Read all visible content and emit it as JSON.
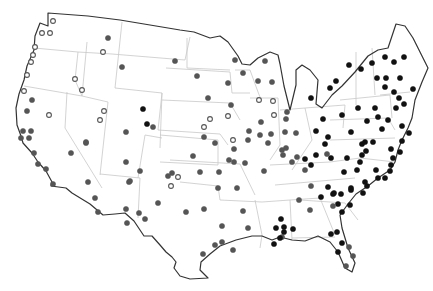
{
  "map": {
    "title": "",
    "region": "Contiguous United States",
    "marker_styles": {
      "open": {
        "fill": "#ffffff",
        "stroke": "#555555"
      },
      "gray": {
        "fill": "#555555",
        "stroke": "#555555"
      },
      "black": {
        "fill": "#111111",
        "stroke": "#111111"
      }
    },
    "points": [
      {
        "x": 53,
        "y": 21,
        "t": "open"
      },
      {
        "x": 42,
        "y": 33,
        "t": "open"
      },
      {
        "x": 50,
        "y": 33,
        "t": "open"
      },
      {
        "x": 35,
        "y": 47,
        "t": "open"
      },
      {
        "x": 33,
        "y": 55,
        "t": "open"
      },
      {
        "x": 31,
        "y": 62,
        "t": "open"
      },
      {
        "x": 27,
        "y": 75,
        "t": "open"
      },
      {
        "x": 24,
        "y": 91,
        "t": "open"
      },
      {
        "x": 32,
        "y": 100,
        "t": "gray"
      },
      {
        "x": 27,
        "y": 111,
        "t": "gray"
      },
      {
        "x": 49,
        "y": 115,
        "t": "open"
      },
      {
        "x": 23,
        "y": 131,
        "t": "gray"
      },
      {
        "x": 31,
        "y": 131,
        "t": "gray"
      },
      {
        "x": 21,
        "y": 138,
        "t": "gray"
      },
      {
        "x": 29,
        "y": 138,
        "t": "gray"
      },
      {
        "x": 34,
        "y": 153,
        "t": "gray"
      },
      {
        "x": 38,
        "y": 164,
        "t": "gray"
      },
      {
        "x": 46,
        "y": 169,
        "t": "gray"
      },
      {
        "x": 53,
        "y": 184,
        "t": "gray"
      },
      {
        "x": 71,
        "y": 153,
        "t": "gray"
      },
      {
        "x": 86,
        "y": 143,
        "t": "gray"
      },
      {
        "x": 75,
        "y": 79,
        "t": "open"
      },
      {
        "x": 82,
        "y": 90,
        "t": "open"
      },
      {
        "x": 108,
        "y": 38,
        "t": "gray"
      },
      {
        "x": 103,
        "y": 52,
        "t": "open"
      },
      {
        "x": 122,
        "y": 67,
        "t": "gray"
      },
      {
        "x": 104,
        "y": 111,
        "t": "open"
      },
      {
        "x": 100,
        "y": 120,
        "t": "open"
      },
      {
        "x": 86,
        "y": 142,
        "t": "gray"
      },
      {
        "x": 126,
        "y": 132,
        "t": "gray"
      },
      {
        "x": 143,
        "y": 109,
        "t": "black"
      },
      {
        "x": 147,
        "y": 124,
        "t": "black"
      },
      {
        "x": 153,
        "y": 127,
        "t": "gray"
      },
      {
        "x": 126,
        "y": 162,
        "t": "gray"
      },
      {
        "x": 140,
        "y": 171,
        "t": "gray"
      },
      {
        "x": 129,
        "y": 182,
        "t": "gray"
      },
      {
        "x": 88,
        "y": 182,
        "t": "gray"
      },
      {
        "x": 95,
        "y": 198,
        "t": "gray"
      },
      {
        "x": 126,
        "y": 209,
        "t": "gray"
      },
      {
        "x": 130,
        "y": 181,
        "t": "gray"
      },
      {
        "x": 139,
        "y": 213,
        "t": "gray"
      },
      {
        "x": 98,
        "y": 212,
        "t": "gray"
      },
      {
        "x": 175,
        "y": 61,
        "t": "gray"
      },
      {
        "x": 197,
        "y": 76,
        "t": "gray"
      },
      {
        "x": 208,
        "y": 98,
        "t": "gray"
      },
      {
        "x": 210,
        "y": 119,
        "t": "open"
      },
      {
        "x": 204,
        "y": 127,
        "t": "open"
      },
      {
        "x": 204,
        "y": 137,
        "t": "gray"
      },
      {
        "x": 215,
        "y": 143,
        "t": "gray"
      },
      {
        "x": 178,
        "y": 177,
        "t": "open"
      },
      {
        "x": 171,
        "y": 186,
        "t": "open"
      },
      {
        "x": 200,
        "y": 172,
        "t": "gray"
      },
      {
        "x": 219,
        "y": 172,
        "t": "gray"
      },
      {
        "x": 231,
        "y": 105,
        "t": "gray"
      },
      {
        "x": 235,
        "y": 60,
        "t": "gray"
      },
      {
        "x": 228,
        "y": 83,
        "t": "gray"
      },
      {
        "x": 243,
        "y": 73,
        "t": "gray"
      },
      {
        "x": 228,
        "y": 116,
        "t": "open"
      },
      {
        "x": 249,
        "y": 131,
        "t": "gray"
      },
      {
        "x": 248,
        "y": 140,
        "t": "gray"
      },
      {
        "x": 233,
        "y": 140,
        "t": "open"
      },
      {
        "x": 234,
        "y": 149,
        "t": "gray"
      },
      {
        "x": 229,
        "y": 160,
        "t": "gray"
      },
      {
        "x": 265,
        "y": 61,
        "t": "gray"
      },
      {
        "x": 258,
        "y": 81,
        "t": "gray"
      },
      {
        "x": 272,
        "y": 82,
        "t": "gray"
      },
      {
        "x": 259,
        "y": 100,
        "t": "open"
      },
      {
        "x": 273,
        "y": 101,
        "t": "open"
      },
      {
        "x": 274,
        "y": 115,
        "t": "open"
      },
      {
        "x": 261,
        "y": 122,
        "t": "gray"
      },
      {
        "x": 260,
        "y": 135,
        "t": "gray"
      },
      {
        "x": 271,
        "y": 134,
        "t": "gray"
      },
      {
        "x": 268,
        "y": 143,
        "t": "gray"
      },
      {
        "x": 286,
        "y": 119,
        "t": "gray"
      },
      {
        "x": 285,
        "y": 132,
        "t": "gray"
      },
      {
        "x": 296,
        "y": 133,
        "t": "gray"
      },
      {
        "x": 311,
        "y": 98,
        "t": "black"
      },
      {
        "x": 287,
        "y": 112,
        "t": "gray"
      },
      {
        "x": 286,
        "y": 148,
        "t": "gray"
      },
      {
        "x": 297,
        "y": 157,
        "t": "gray"
      },
      {
        "x": 316,
        "y": 131,
        "t": "black"
      },
      {
        "x": 283,
        "y": 155,
        "t": "gray"
      },
      {
        "x": 305,
        "y": 159,
        "t": "black"
      },
      {
        "x": 311,
        "y": 165,
        "t": "black"
      },
      {
        "x": 305,
        "y": 170,
        "t": "gray"
      },
      {
        "x": 325,
        "y": 144,
        "t": "black"
      },
      {
        "x": 331,
        "y": 158,
        "t": "black"
      },
      {
        "x": 347,
        "y": 158,
        "t": "black"
      },
      {
        "x": 360,
        "y": 162,
        "t": "black"
      },
      {
        "x": 362,
        "y": 144,
        "t": "black"
      },
      {
        "x": 373,
        "y": 142,
        "t": "black"
      },
      {
        "x": 366,
        "y": 151,
        "t": "black"
      },
      {
        "x": 357,
        "y": 170,
        "t": "black"
      },
      {
        "x": 378,
        "y": 178,
        "t": "black"
      },
      {
        "x": 367,
        "y": 186,
        "t": "black"
      },
      {
        "x": 351,
        "y": 190,
        "t": "black"
      },
      {
        "x": 333,
        "y": 194,
        "t": "black"
      },
      {
        "x": 328,
        "y": 187,
        "t": "black"
      },
      {
        "x": 321,
        "y": 197,
        "t": "black"
      },
      {
        "x": 311,
        "y": 186,
        "t": "gray"
      },
      {
        "x": 299,
        "y": 200,
        "t": "gray"
      },
      {
        "x": 310,
        "y": 210,
        "t": "gray"
      },
      {
        "x": 281,
        "y": 219,
        "t": "black"
      },
      {
        "x": 282,
        "y": 237,
        "t": "gray"
      },
      {
        "x": 274,
        "y": 244,
        "t": "black"
      },
      {
        "x": 284,
        "y": 227,
        "t": "black"
      },
      {
        "x": 298,
        "y:": 0,
        "t": "black"
      },
      {
        "x": 338,
        "y": 204,
        "t": "black"
      },
      {
        "x": 334,
        "y": 193,
        "t": "black"
      },
      {
        "x": 342,
        "y": 212,
        "t": "black"
      },
      {
        "x": 293,
        "y": 229,
        "t": "black"
      },
      {
        "x": 331,
        "y": 234,
        "t": "black"
      },
      {
        "x": 342,
        "y": 243,
        "t": "black"
      },
      {
        "x": 338,
        "y": 252,
        "t": "black"
      },
      {
        "x": 349,
        "y": 247,
        "t": "gray"
      },
      {
        "x": 353,
        "y": 256,
        "t": "gray"
      },
      {
        "x": 346,
        "y": 266,
        "t": "gray"
      },
      {
        "x": 234,
        "y": 162,
        "t": "gray"
      },
      {
        "x": 245,
        "y": 163,
        "t": "gray"
      },
      {
        "x": 264,
        "y": 171,
        "t": "gray"
      },
      {
        "x": 237,
        "y": 188,
        "t": "gray"
      },
      {
        "x": 218,
        "y": 188,
        "t": "gray"
      },
      {
        "x": 243,
        "y": 211,
        "t": "gray"
      },
      {
        "x": 248,
        "y": 228,
        "t": "gray"
      },
      {
        "x": 204,
        "y": 209,
        "t": "gray"
      },
      {
        "x": 186,
        "y": 212,
        "t": "gray"
      },
      {
        "x": 215,
        "y": 245,
        "t": "gray"
      },
      {
        "x": 222,
        "y": 242,
        "t": "gray"
      },
      {
        "x": 222,
        "y": 226,
        "t": "gray"
      },
      {
        "x": 203,
        "y": 254,
        "t": "gray"
      },
      {
        "x": 233,
        "y": 250,
        "t": "gray"
      },
      {
        "x": 280,
        "y": 238,
        "t": "black"
      },
      {
        "x": 276,
        "y": 228,
        "t": "black"
      },
      {
        "x": 284,
        "y": 232,
        "t": "black"
      },
      {
        "x": 193,
        "y": 156,
        "t": "gray"
      },
      {
        "x": 172,
        "y": 173,
        "t": "gray"
      },
      {
        "x": 158,
        "y": 203,
        "t": "gray"
      },
      {
        "x": 168,
        "y": 176,
        "t": "gray"
      },
      {
        "x": 145,
        "y": 219,
        "t": "gray"
      },
      {
        "x": 127,
        "y": 223,
        "t": "gray"
      },
      {
        "x": 282,
        "y": 150,
        "t": "gray"
      },
      {
        "x": 292,
        "y": 162,
        "t": "gray"
      },
      {
        "x": 330,
        "y": 88,
        "t": "black"
      },
      {
        "x": 336,
        "y": 81,
        "t": "black"
      },
      {
        "x": 349,
        "y": 65,
        "t": "black"
      },
      {
        "x": 361,
        "y": 69,
        "t": "black"
      },
      {
        "x": 372,
        "y": 63,
        "t": "black"
      },
      {
        "x": 385,
        "y": 57,
        "t": "black"
      },
      {
        "x": 394,
        "y": 62,
        "t": "black"
      },
      {
        "x": 404,
        "y": 57,
        "t": "black"
      },
      {
        "x": 400,
        "y": 78,
        "t": "black"
      },
      {
        "x": 386,
        "y": 78,
        "t": "black"
      },
      {
        "x": 377,
        "y": 78,
        "t": "black"
      },
      {
        "x": 385,
        "y": 87,
        "t": "black"
      },
      {
        "x": 394,
        "y": 92,
        "t": "black"
      },
      {
        "x": 399,
        "y": 98,
        "t": "black"
      },
      {
        "x": 413,
        "y": 89,
        "t": "black"
      },
      {
        "x": 404,
        "y": 104,
        "t": "black"
      },
      {
        "x": 396,
        "y": 108,
        "t": "black"
      },
      {
        "x": 375,
        "y": 108,
        "t": "black"
      },
      {
        "x": 358,
        "y": 108,
        "t": "black"
      },
      {
        "x": 342,
        "y": 115,
        "t": "black"
      },
      {
        "x": 367,
        "y": 121,
        "t": "black"
      },
      {
        "x": 378,
        "y": 117,
        "t": "black"
      },
      {
        "x": 388,
        "y": 120,
        "t": "black"
      },
      {
        "x": 382,
        "y": 129,
        "t": "black"
      },
      {
        "x": 402,
        "y": 126,
        "t": "black"
      },
      {
        "x": 409,
        "y": 133,
        "t": "black"
      },
      {
        "x": 402,
        "y": 141,
        "t": "black"
      },
      {
        "x": 391,
        "y": 149,
        "t": "black"
      },
      {
        "x": 393,
        "y": 158,
        "t": "black"
      },
      {
        "x": 365,
        "y": 142,
        "t": "black"
      },
      {
        "x": 351,
        "y": 132,
        "t": "black"
      },
      {
        "x": 323,
        "y": 119,
        "t": "black"
      },
      {
        "x": 328,
        "y": 137,
        "t": "black"
      },
      {
        "x": 316,
        "y": 155,
        "t": "black"
      },
      {
        "x": 327,
        "y": 154,
        "t": "gray"
      },
      {
        "x": 344,
        "y": 172,
        "t": "black"
      },
      {
        "x": 362,
        "y": 155,
        "t": "black"
      },
      {
        "x": 391,
        "y": 165,
        "t": "black"
      },
      {
        "x": 390,
        "y": 171,
        "t": "black"
      },
      {
        "x": 400,
        "y": 152,
        "t": "black"
      },
      {
        "x": 376,
        "y": 170,
        "t": "black"
      },
      {
        "x": 341,
        "y": 194,
        "t": "black"
      },
      {
        "x": 351,
        "y": 188,
        "t": "black"
      },
      {
        "x": 365,
        "y": 182,
        "t": "black"
      },
      {
        "x": 350,
        "y": 205,
        "t": "black"
      },
      {
        "x": 333,
        "y": 206,
        "t": "gray"
      },
      {
        "x": 358,
        "y:": 0,
        "t": "black"
      },
      {
        "x": 385,
        "y": 178,
        "t": "black"
      },
      {
        "x": 337,
        "y": 232,
        "t": "black"
      },
      {
        "x": 363,
        "y": 193,
        "t": "black"
      }
    ]
  }
}
